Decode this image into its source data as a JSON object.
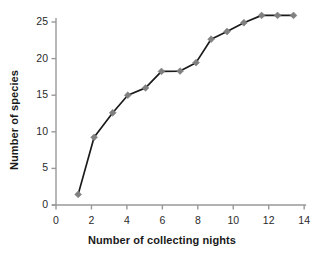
{
  "chart_data": {
    "type": "line",
    "title": "",
    "xlabel": "Number of collecting nights",
    "ylabel": "Number of species",
    "xlim": [
      0,
      14
    ],
    "ylim": [
      0,
      26.6
    ],
    "xticks": [
      0,
      2,
      4,
      6,
      8,
      10,
      12,
      14
    ],
    "yticks": [
      0,
      5,
      10,
      15,
      20,
      25
    ],
    "xtick_labels": [
      "0",
      "2",
      "4",
      "6",
      "8",
      "10",
      "12",
      "14"
    ],
    "ytick_labels": [
      "0",
      "5",
      "10",
      "15",
      "20",
      "25"
    ],
    "grid": false,
    "legend": null,
    "marker": "diamond",
    "marker_color": "#808080",
    "line_color": "#1a1a1a",
    "axis_color": "#999999",
    "x": [
      1.25,
      2.15,
      3.2,
      4.05,
      5.05,
      5.95,
      7.0,
      7.9,
      8.75,
      9.65,
      10.6,
      11.6,
      12.5,
      13.4
    ],
    "y": [
      1.45,
      9.25,
      12.6,
      15.0,
      16.0,
      18.25,
      18.3,
      19.45,
      22.65,
      23.7,
      24.9,
      25.9,
      25.9,
      25.9
    ],
    "points": [
      {
        "x": 1.25,
        "y": 1.45
      },
      {
        "x": 2.15,
        "y": 9.25
      },
      {
        "x": 3.2,
        "y": 12.6
      },
      {
        "x": 4.05,
        "y": 15.0
      },
      {
        "x": 5.05,
        "y": 16.0
      },
      {
        "x": 5.95,
        "y": 18.25
      },
      {
        "x": 7.0,
        "y": 18.3
      },
      {
        "x": 7.9,
        "y": 19.45
      },
      {
        "x": 8.75,
        "y": 22.65
      },
      {
        "x": 9.65,
        "y": 23.7
      },
      {
        "x": 10.6,
        "y": 24.9
      },
      {
        "x": 11.6,
        "y": 25.9
      },
      {
        "x": 12.5,
        "y": 25.9
      },
      {
        "x": 13.4,
        "y": 25.9
      }
    ]
  }
}
